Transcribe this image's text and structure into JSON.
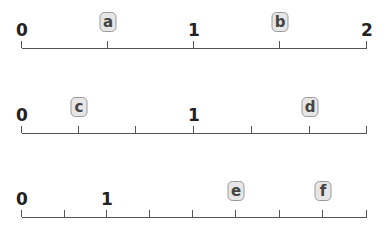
{
  "number_lines": [
    {
      "id": "line1",
      "y": 48,
      "x_start": 22,
      "x_end": 367,
      "ticks_x": [
        22,
        108,
        194,
        280,
        367
      ],
      "numbers": [
        {
          "text": "0",
          "x": 22
        },
        {
          "text": "1",
          "x": 194
        },
        {
          "text": "2",
          "x": 367
        }
      ],
      "labels": [
        {
          "text": "a",
          "x": 108
        },
        {
          "text": "b",
          "x": 280
        }
      ]
    },
    {
      "id": "line2",
      "y": 133,
      "x_start": 22,
      "x_end": 367,
      "ticks_x": [
        22,
        79,
        136,
        194,
        252,
        310,
        367
      ],
      "numbers": [
        {
          "text": "0",
          "x": 22
        },
        {
          "text": "1",
          "x": 194
        }
      ],
      "labels": [
        {
          "text": "c",
          "x": 79
        },
        {
          "text": "d",
          "x": 310
        }
      ]
    },
    {
      "id": "line3",
      "y": 217,
      "x_start": 22,
      "x_end": 367,
      "ticks_x": [
        22,
        65,
        107,
        150,
        193,
        236,
        280,
        323,
        367
      ],
      "numbers": [
        {
          "text": "0",
          "x": 22
        },
        {
          "text": "1",
          "x": 107
        }
      ],
      "labels": [
        {
          "text": "e",
          "x": 236
        },
        {
          "text": "f",
          "x": 323
        }
      ]
    }
  ],
  "colors": {
    "line": "#555555",
    "label_bg": "#e6e6e6",
    "label_border": "#999999",
    "text": "#222222"
  }
}
